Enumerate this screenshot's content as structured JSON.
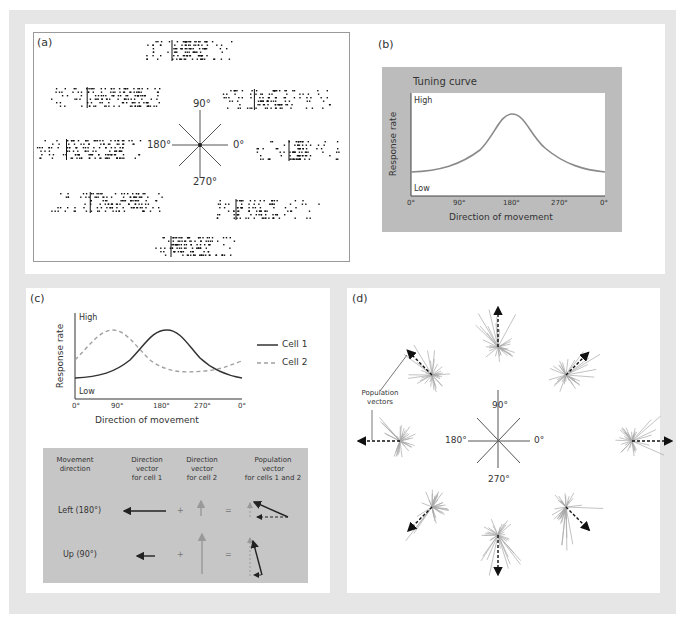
{
  "figure": {
    "panel_labels": {
      "a": "(a)",
      "b": "(b)",
      "c": "(c)",
      "d": "(d)"
    }
  },
  "panel_a": {
    "compass": {
      "up": "90°",
      "left": "180°",
      "right": "0°",
      "down": "270°"
    },
    "description": "Spike raster plots for eight movement directions arranged around a compass"
  },
  "panel_b": {
    "title": "Tuning curve",
    "ylabel": "Response rate",
    "y_high": "High",
    "y_low": "Low",
    "xlabel": "Direction of movement",
    "xticks": [
      "0°",
      "90°",
      "180°",
      "270°",
      "0°"
    ]
  },
  "panel_c": {
    "ylabel": "Response rate",
    "y_high": "High",
    "y_low": "Low",
    "xlabel": "Direction of movement",
    "xticks": [
      "0°",
      "90°",
      "180°",
      "270°",
      "0°"
    ],
    "legend": [
      {
        "label": "Cell 1",
        "style": "solid",
        "color": "#333333"
      },
      {
        "label": "Cell 2",
        "style": "dashed",
        "color": "#a0a0a0"
      }
    ],
    "table": {
      "headers": [
        [
          "Movement",
          "direction"
        ],
        [
          "Direction",
          "vector",
          "for cell 1"
        ],
        [
          "Direction",
          "vector",
          "for cell 2"
        ],
        [
          "Population",
          "vector",
          "for cells 1 and 2"
        ]
      ],
      "rows": [
        {
          "direction": "Left (180°)",
          "plus": "+",
          "equals": "="
        },
        {
          "direction": "Up (90°)",
          "plus": "+",
          "equals": "="
        }
      ]
    }
  },
  "panel_d": {
    "annotation": [
      "Population",
      "vectors"
    ],
    "compass": {
      "up": "90°",
      "left": "180°",
      "right": "0°",
      "down": "270°"
    }
  },
  "chart_data": [
    {
      "type": "line",
      "title": "Tuning curve",
      "xlabel": "Direction of movement",
      "ylabel": "Response rate",
      "x_ticks": [
        "0°",
        "90°",
        "180°",
        "270°",
        "0°"
      ],
      "x": [
        0,
        45,
        90,
        135,
        180,
        225,
        270,
        315,
        360
      ],
      "series": [
        {
          "name": "Tuning curve",
          "values": [
            0.28,
            0.33,
            0.45,
            0.78,
            0.95,
            0.75,
            0.45,
            0.34,
            0.28
          ]
        }
      ],
      "ylim": [
        0,
        1
      ],
      "y_tick_labels": [
        "Low",
        "High"
      ]
    },
    {
      "type": "line",
      "xlabel": "Direction of movement",
      "ylabel": "Response rate",
      "x_ticks": [
        "0°",
        "90°",
        "180°",
        "270°",
        "0°"
      ],
      "x": [
        0,
        45,
        90,
        135,
        180,
        225,
        270,
        315,
        360
      ],
      "series": [
        {
          "name": "Cell 1",
          "values": [
            0.28,
            0.33,
            0.45,
            0.78,
            0.95,
            0.75,
            0.45,
            0.34,
            0.28
          ]
        },
        {
          "name": "Cell 2",
          "values": [
            0.6,
            0.85,
            0.95,
            0.75,
            0.5,
            0.4,
            0.38,
            0.42,
            0.58
          ]
        }
      ],
      "legend_position": "right",
      "ylim": [
        0,
        1
      ],
      "y_tick_labels": [
        "Low",
        "High"
      ]
    }
  ]
}
